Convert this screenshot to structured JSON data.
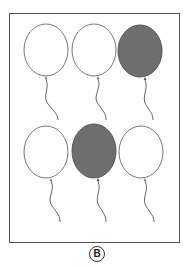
{
  "figure": {
    "option_label": "B",
    "rows": [
      {
        "balloons": [
          {
            "filled": false
          },
          {
            "filled": false
          },
          {
            "filled": true
          }
        ]
      },
      {
        "balloons": [
          {
            "filled": false
          },
          {
            "filled": true
          },
          {
            "filled": false
          }
        ]
      }
    ],
    "colors": {
      "outline": "#666666",
      "fill_dark": "#6e6e6e",
      "fill_light": "#ffffff",
      "frame_border": "#555555"
    },
    "counts": {
      "total_balloons": 6,
      "filled_balloons": 2,
      "unfilled_balloons": 4
    }
  }
}
